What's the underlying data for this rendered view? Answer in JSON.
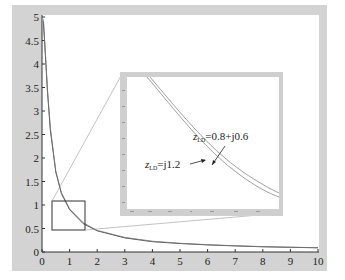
{
  "chart_data": [
    {
      "type": "line",
      "title": "",
      "xlabel": "",
      "ylabel": "",
      "xlim": [
        0,
        10
      ],
      "ylim": [
        0,
        5
      ],
      "x_ticks": [
        "0",
        "1",
        "2",
        "3",
        "4",
        "5",
        "6",
        "7",
        "8",
        "9",
        "10"
      ],
      "y_ticks": [
        "0",
        "0.5",
        "1",
        "1.5",
        "2",
        "2.5",
        "3",
        "3.5",
        "4",
        "4.5",
        "5"
      ],
      "grid": false,
      "series": [
        {
          "name": "z_LD = j1.2",
          "x": [
            0.05,
            0.1,
            0.2,
            0.3,
            0.5,
            0.7,
            1,
            1.5,
            2,
            3,
            4,
            5,
            6,
            7,
            8,
            9,
            10
          ],
          "values": [
            4.9,
            4.4,
            3.4,
            2.6,
            1.7,
            1.25,
            0.9,
            0.6,
            0.45,
            0.3,
            0.22,
            0.18,
            0.15,
            0.13,
            0.11,
            0.1,
            0.09
          ]
        },
        {
          "name": "z_LD = 0.8+j0.6",
          "x": [
            0.05,
            0.1,
            0.2,
            0.3,
            0.5,
            0.7,
            1,
            1.5,
            2,
            3,
            4,
            5,
            6,
            7,
            8,
            9,
            10
          ],
          "values": [
            4.95,
            4.45,
            3.45,
            2.65,
            1.72,
            1.27,
            0.92,
            0.62,
            0.46,
            0.31,
            0.23,
            0.185,
            0.155,
            0.132,
            0.115,
            0.102,
            0.092
          ]
        }
      ],
      "annotations": [
        {
          "type": "zoom-box",
          "x_range": [
            0.35,
            1.55
          ],
          "y_range": [
            0.43,
            1.07
          ]
        }
      ]
    },
    {
      "type": "line",
      "title": "Inset (magnified region)",
      "xlim": [
        0.35,
        1.55
      ],
      "ylim": [
        0.43,
        1.07
      ],
      "grid": false,
      "legend": [
        {
          "label": "z_LD=j1.2",
          "base": "z",
          "subscript": "LD",
          "rest": "=j1.2"
        },
        {
          "label": "z_LD=0.8+j0.6",
          "base": "z",
          "subscript": "LD",
          "rest": "=0.8+j0.6"
        }
      ]
    }
  ],
  "labels": {
    "series1_base": "z",
    "series1_sub": "LD",
    "series1_rest": "=j1.2",
    "series2_base": "z",
    "series2_sub": "LD",
    "series2_rest": "=0.8+j0.6"
  },
  "axis": {
    "x": [
      "0",
      "1",
      "2",
      "3",
      "4",
      "5",
      "6",
      "7",
      "8",
      "9",
      "10"
    ],
    "y": [
      "0",
      "0.5",
      "1",
      "1.5",
      "2",
      "2.5",
      "3",
      "3.5",
      "4",
      "4.5",
      "5"
    ]
  },
  "colors": {
    "frame": "#d3d3d3",
    "plot_bg": "#ffffff",
    "curve": "#555555",
    "box": "#333333",
    "connector": "#999999"
  }
}
